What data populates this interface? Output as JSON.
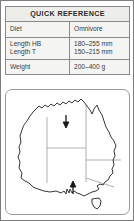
{
  "panel": {
    "title": "QUICK REFERENCE",
    "border_color": "#7d7d7d",
    "header_bg": "#ededea",
    "cell_bg": "#f4f4f2",
    "text_color": "#3a3a3a"
  },
  "table": {
    "header": "QUICK REFERENCE",
    "rows": [
      {
        "id": "diet",
        "labels": [
          "Diet"
        ],
        "values": [
          "Omnivore"
        ]
      },
      {
        "id": "length",
        "labels": [
          "Length HB",
          "Length T"
        ],
        "values": [
          "180–255 mm",
          "150–215 mm"
        ]
      },
      {
        "id": "weight",
        "labels": [
          "Weight"
        ],
        "values": [
          "200–400 g"
        ]
      }
    ]
  },
  "map": {
    "name": "australia-distribution-map",
    "outline_color": "#2b2b2b",
    "border_color": "#9a9a9a",
    "state_border_color": "#8c8c8c",
    "annotations": [
      {
        "name": "arrow-down",
        "direction": "down",
        "x": 66,
        "y": 118
      },
      {
        "name": "arrow-up",
        "direction": "up",
        "x": 73,
        "y": 182
      }
    ],
    "islands": [
      "Tasmania"
    ]
  }
}
